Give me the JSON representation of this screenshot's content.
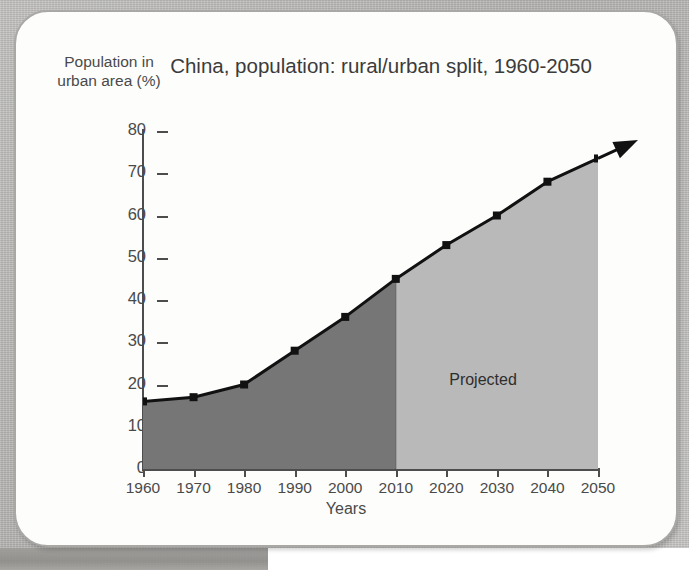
{
  "chart_data": {
    "type": "area",
    "title": "China, population: rural/urban split,\n1960-2050",
    "xlabel": "Years",
    "ylabel": "Population in\nurban area (%)",
    "categories": [
      1960,
      1970,
      1980,
      1990,
      2000,
      2010,
      2020,
      2030,
      2040,
      2050
    ],
    "values": [
      16,
      17,
      20,
      28,
      36,
      45,
      53,
      60,
      68,
      73.5
    ],
    "series": [
      {
        "name": "Population in urban area (%)",
        "values": [
          16,
          17,
          20,
          28,
          36,
          45,
          53,
          60,
          68,
          73.5
        ]
      }
    ],
    "xlim": [
      1960,
      2050
    ],
    "ylim": [
      0,
      80
    ],
    "y_ticks": [
      0,
      10,
      20,
      30,
      40,
      50,
      60,
      70,
      80
    ],
    "x_ticks": [
      1960,
      1970,
      1980,
      1990,
      2000,
      2010,
      2020,
      2030,
      2040,
      2050
    ],
    "grid": false,
    "legend": "none",
    "annotations": [
      {
        "text": "Projected",
        "x": 2030,
        "y": 23,
        "note": "label inside light-shaded region"
      }
    ],
    "regions": [
      {
        "name": "historical",
        "x_start": 1960,
        "x_end": 2010,
        "color": "#767676"
      },
      {
        "name": "projected",
        "x_start": 2010,
        "x_end": 2050,
        "color": "#b9b9b9"
      }
    ],
    "colors": {
      "line": "#111111",
      "marker": "#111111",
      "historical_fill": "#767676",
      "projected_fill": "#b9b9b9",
      "axis": "#4d4d4d",
      "text": "#4a4a4a",
      "card_background": "#fdfdfc",
      "page_background": "#b9b8b6"
    },
    "arrow_at_end": true
  },
  "labels": {
    "y_axis_title": "Population in\nurban area (%)",
    "x_axis_title": "Years",
    "chart_title": "China, population: rural/urban split,\n1960-2050",
    "projected": "Projected",
    "y_ticks": [
      "80",
      "70",
      "60",
      "50",
      "40",
      "30",
      "20",
      "10",
      "0"
    ],
    "x_ticks": [
      "1960",
      "1970",
      "1980",
      "1990",
      "2000",
      "2010",
      "2020",
      "2030",
      "2040",
      "2050"
    ]
  }
}
